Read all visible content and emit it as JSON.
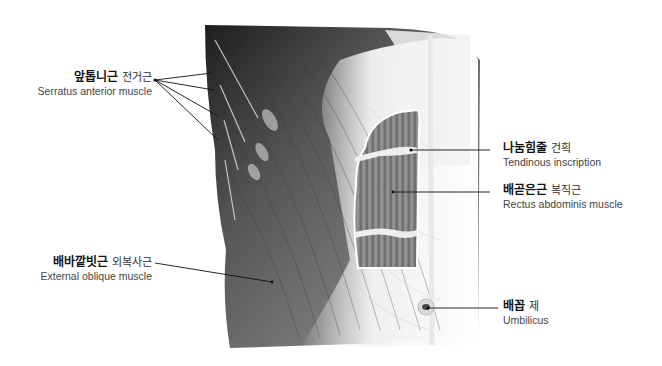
{
  "labels": {
    "serratus": {
      "korean": "앞톱니근",
      "sino_korean": "전거근",
      "english": "Serratus anterior muscle"
    },
    "external_oblique": {
      "korean": "배바깥빗근",
      "sino_korean": "외복사근",
      "english": "External oblique  muscle"
    },
    "tendinous": {
      "korean": "나눔힘줄",
      "sino_korean": "건획",
      "english": "Tendinous inscription"
    },
    "rectus": {
      "korean": "배곧은근",
      "sino_korean": "복직근",
      "english": "Rectus abdominis muscle"
    },
    "umbilicus": {
      "korean": "배꼽",
      "sino_korean": "제",
      "english": "Umbilicus"
    }
  },
  "colors": {
    "muscle_dark": "#2a2a2a",
    "muscle_mid": "#6a6a6a",
    "fascia": "#f2f2f2",
    "rectus": "#8a8a8a",
    "leader": "#111111"
  }
}
